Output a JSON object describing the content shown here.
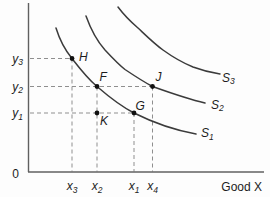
{
  "figure": {
    "width": 270,
    "height": 197,
    "colors": {
      "background": "#fdfdfd",
      "axis": "#606060",
      "curve": "#3b3b3b",
      "dash": "#8f8f8f",
      "point": "#111111",
      "text": "#1c1c1c"
    },
    "axes": {
      "origin_label": "0",
      "x_axis_title": "Good X",
      "y_axis": {
        "x": 28.5,
        "y_top": 3,
        "y_bottom": 172
      },
      "x_axis": {
        "y": 172,
        "x_left": 28,
        "x_right": 264
      }
    },
    "y_ticks": [
      {
        "base": "y",
        "sub": "3",
        "y": 58.5,
        "dash_to_x": 72,
        "label_x": 23,
        "label_y": 62.5
      },
      {
        "base": "y",
        "sub": "2",
        "y": 86.5,
        "dash_to_x": 152.5,
        "label_x": 23,
        "label_y": 90.5
      },
      {
        "base": "y",
        "sub": "1",
        "y": 113,
        "dash_to_x": 134,
        "label_x": 23,
        "label_y": 117
      }
    ],
    "x_ticks": [
      {
        "base": "x",
        "sub": "3",
        "x": 72,
        "dash_from_y": 58.5,
        "label_y": 190
      },
      {
        "base": "x",
        "sub": "2",
        "x": 97,
        "dash_from_y": 86.5,
        "label_y": 190
      },
      {
        "base": "x",
        "sub": "1",
        "x": 134,
        "dash_from_y": 113,
        "label_y": 190
      },
      {
        "base": "x",
        "sub": "4",
        "x": 152.5,
        "dash_from_y": 86.5,
        "label_y": 190
      }
    ],
    "curves": [
      {
        "base": "S",
        "sub": "1",
        "path": "M56,28 C60,41 65,50 72,58.5 C79,67.5 87.5,78.5 97,86.5 C108,96 119.5,105.5 134,113 C151,121.5 174,130 196,134",
        "label_x": 201,
        "label_y": 137
      },
      {
        "base": "S",
        "sub": "2",
        "path": "M86,16 C91,30 97,41 105,50 C112,57.5 118,64 125,69.5 C134,75.5 143,81.5 152.5,86.5 C168,92 186,98.5 205,103",
        "label_x": 211,
        "label_y": 108.5
      },
      {
        "base": "S",
        "sub": "3",
        "path": "M118,7 C124,15 131,22 138,28 C146,35.5 154,43.5 163,50 C172,56.5 182,62.5 193,67 C201,70 210,72.5 220,74",
        "label_x": 222,
        "label_y": 81.5
      }
    ],
    "points": [
      {
        "label": "H",
        "x": 72,
        "y": 58.5,
        "label_x": 79,
        "label_y": 61
      },
      {
        "label": "F",
        "x": 97,
        "y": 86.5,
        "label_x": 99.5,
        "label_y": 80.5
      },
      {
        "label": "J",
        "x": 152.5,
        "y": 86.5,
        "label_x": 155.5,
        "label_y": 81
      },
      {
        "label": "K",
        "x": 97,
        "y": 113,
        "label_x": 100,
        "label_y": 125
      },
      {
        "label": "G",
        "x": 134,
        "y": 113,
        "label_x": 135.5,
        "label_y": 109.5
      }
    ]
  },
  "chart_data": {
    "type": "line",
    "title": "",
    "xlabel": "Good X",
    "ylabel": "",
    "grid": false,
    "legend": "none",
    "x_tick_labels": [
      "x3",
      "x2",
      "x1",
      "x4"
    ],
    "y_tick_labels": [
      "y3",
      "y2",
      "y1"
    ],
    "origin_label": "0",
    "series": [
      {
        "name": "S1",
        "description": "lowest indifference curve, convex to origin, passes through H, F, G"
      },
      {
        "name": "S2",
        "description": "middle indifference curve, convex to origin, passes through J"
      },
      {
        "name": "S3",
        "description": "highest indifference curve, convex to origin"
      }
    ],
    "labeled_points": [
      {
        "name": "H",
        "x": "x3",
        "y": "y3",
        "on_curve": "S1"
      },
      {
        "name": "F",
        "x": "x2",
        "y": "y2",
        "on_curve": "S1"
      },
      {
        "name": "J",
        "x": "x4",
        "y": "y2",
        "on_curve": "S2"
      },
      {
        "name": "K",
        "x": "x2",
        "y": "y1",
        "on_curve": null
      },
      {
        "name": "G",
        "x": "x1",
        "y": "y1",
        "on_curve": "S1"
      }
    ]
  }
}
